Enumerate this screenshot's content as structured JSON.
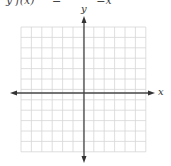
{
  "header_fragment": "y f(x)     =          =x",
  "axes": {
    "x_label": "x",
    "y_label": "y"
  },
  "grid": {
    "columns": 12,
    "rows": 12,
    "left": 21,
    "top": 27,
    "cell": 10.4,
    "line_color": "#d4d4d4",
    "axis_color": "#444444"
  }
}
